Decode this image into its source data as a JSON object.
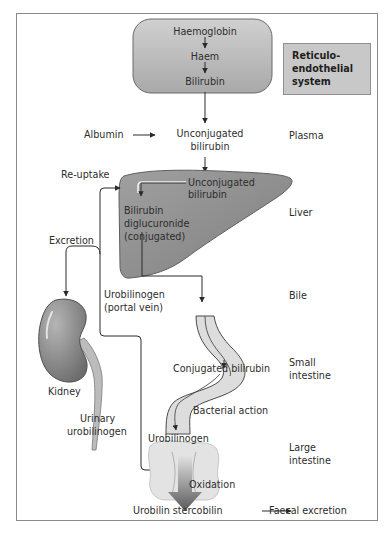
{
  "diagram": {
    "type": "bilirubin-metabolism-flowchart",
    "reticuloendothelial": {
      "steps": [
        "Haemoglobin",
        "Haem",
        "Bilirubin"
      ],
      "box_label_lines": [
        "Reticulo-",
        "endothelial",
        "system"
      ]
    },
    "zones": {
      "plasma": "Plasma",
      "liver": "Liver",
      "bile": "Bile",
      "small_intestine_lines": [
        "Small",
        "intestine"
      ],
      "large_intestine_lines": [
        "Large",
        "intestine"
      ]
    },
    "labels": {
      "albumin": "Albumin",
      "unconjugated_plasma_lines": [
        "Unconjugated",
        "bilirubin"
      ],
      "re_uptake": "Re-uptake",
      "unconjugated_liver_lines": [
        "Unconjugated",
        "bilirubin"
      ],
      "conjugated_lines": [
        "Bilirubin",
        "diglucuronide",
        "(conjugated)"
      ],
      "excretion": "Excretion",
      "urobilinogen_portal_lines": [
        "Urobilinogen",
        "(portal vein)"
      ],
      "kidney": "Kidney",
      "urinary_lines": [
        "Urinary",
        "urobilinogen"
      ],
      "conjugated_bilirubin_si": "Conjugated bilirubin",
      "bacterial_action": "Bacterial action",
      "urobilinogen_li": "Urobilinogen",
      "oxidation": "Oxidation",
      "urobilin_stercobilin": "Urobilin stercobilin",
      "faecal_excretion": "Faecal excretion"
    },
    "colors": {
      "re_block_fill": "#bdbdbd",
      "re_box_fill": "#c8c8c8",
      "liver_fill": "#8e8e8e",
      "kidney_fill": "#8a8a8a",
      "intestine_fill": "#dcdcdc",
      "line": "#3a3a3a"
    }
  }
}
